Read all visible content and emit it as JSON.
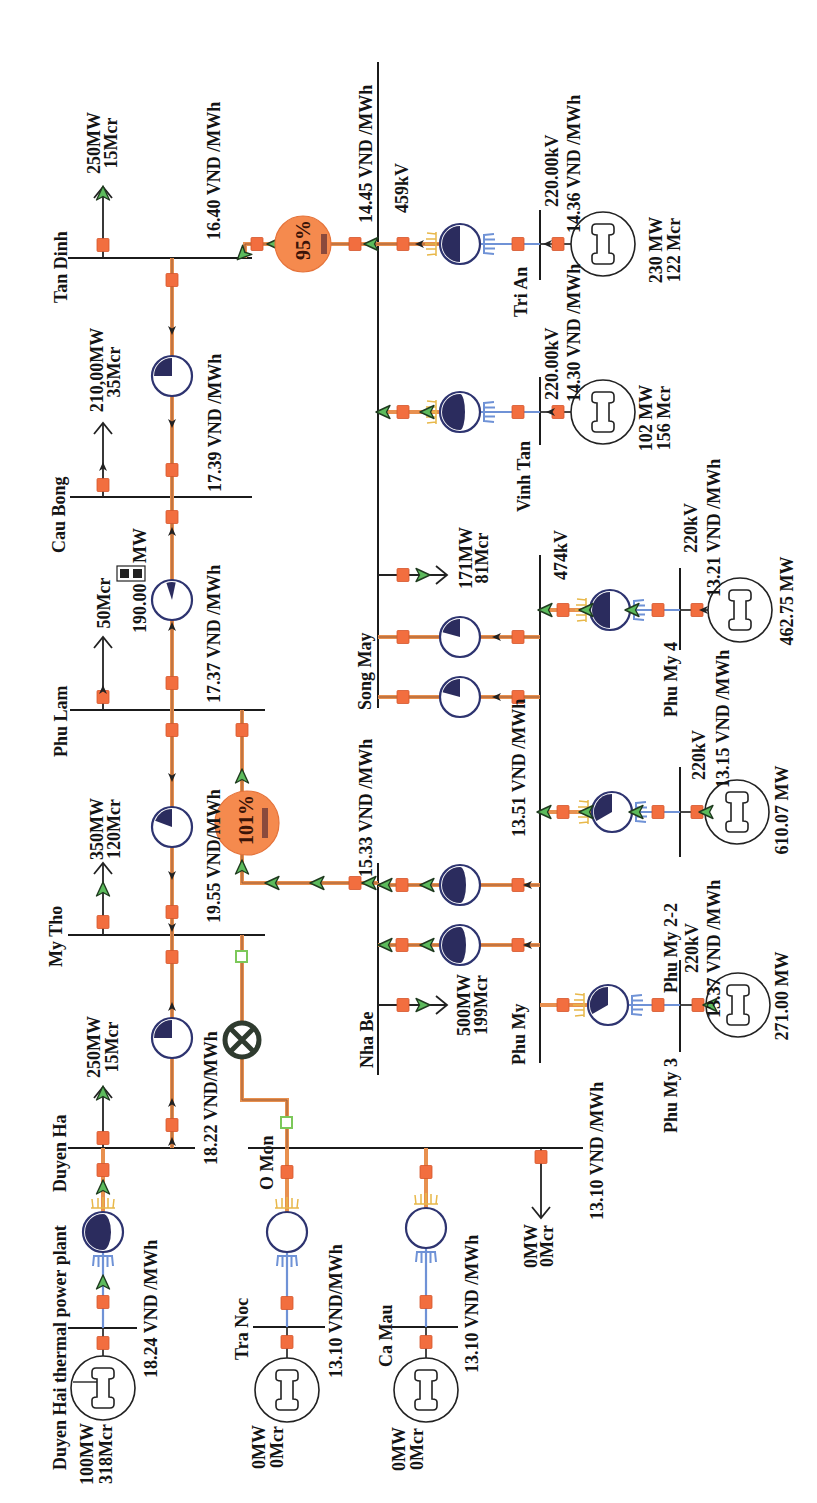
{
  "diagram": {
    "kind": "power system one-line diagram",
    "orientation": "rotated 90 degrees counter-clockwise"
  },
  "buses": {
    "tan_dinh": {
      "name": "Tan Dinh",
      "price": "16.40 VND /MWh"
    },
    "cau_bong": {
      "name": "Cau Bong",
      "price": "17.39 VND /MWh"
    },
    "phu_lam": {
      "name": "Phu Lam",
      "price": "17.37 VND /MWh"
    },
    "my_tho": {
      "name": "My Tho",
      "price": "19.55 VND/MWh"
    },
    "duyen_ha": {
      "name": "Duyen Ha",
      "price": "18.22 VND/MWh"
    },
    "duyen_hai": {
      "name": "Duyen  Hai thermal power plant",
      "price": "18.24 VND /MWh"
    },
    "o_mon": {
      "name": "O Mon",
      "price": "13.10 VND /MWh"
    },
    "tra_noc": {
      "name": "Tra Noc",
      "price": "13.10 VND/MWh"
    },
    "ca_mau": {
      "name": "Ca Mau",
      "price": "13.10 VND /MWh"
    },
    "song_may": {
      "name": "Song May",
      "voltage": "459kV",
      "price": "14.45 VND /MWh"
    },
    "nha_be": {
      "name": "Nha Be",
      "price": "15.33 VND /MWh"
    },
    "phu_my": {
      "name": "Phu My",
      "voltage": "474kV",
      "price": "13.51 VND /MWh"
    },
    "tri_an": {
      "name": "Tri An",
      "voltage": "220.00kV",
      "price": "14.36 VND /MWh"
    },
    "vinh_tan": {
      "name": "Vinh Tan",
      "voltage": "220.00kV",
      "price": "14.30 VND /MWh"
    },
    "phu_my_4": {
      "name": "Phu My 4",
      "voltage": "220kV",
      "price": "13.21 VND /MWh"
    },
    "phu_my_2_2": {
      "name": "Phu My 2-2",
      "voltage": "220kV",
      "price": "13.15 VND /MWh"
    },
    "phu_my_3": {
      "name": "Phu My 3",
      "voltage": "220kV",
      "price": "13.37 VND /MWh"
    }
  },
  "loads": {
    "tan_dinh": {
      "mw": "250MW",
      "mvar": "15Mcr"
    },
    "cau_bong": {
      "mw": "210,00MW",
      "mvar": "35Mcr"
    },
    "phu_lam": {
      "mvar": "50Mcr",
      "flow_value": "190.00",
      "flow_unit": "MW"
    },
    "my_tho": {
      "mw": "350MW",
      "mvar": "120Mcr"
    },
    "duyen_ha": {
      "mw": "250MW",
      "mvar": "15Mcr"
    },
    "o_mon": {
      "mw": "0MW",
      "mvar": "0Mcr"
    },
    "song_may": {
      "mw": "171MW",
      "mvar": "81Mcr"
    },
    "nha_be": {
      "mw": "500MW",
      "mvar": "199Mcr"
    }
  },
  "generators": {
    "duyen_hai": {
      "mw": "100MW",
      "mvar": "318Mcr"
    },
    "tra_noc": {
      "mw": "0MW",
      "mvar": "0Mcr"
    },
    "ca_mau": {
      "mw": "0MW",
      "mvar": "0Mcr"
    },
    "tri_an": {
      "mw": "230 MW",
      "mvar": "122 Mcr"
    },
    "vinh_tan": {
      "mw": "102 MW",
      "mvar": "156 Mcr"
    },
    "phu_my_4": {
      "mw": "462.75 MW"
    },
    "phu_my_2_2": {
      "mw": "610.07 MW"
    },
    "phu_my_3": {
      "mw": "271.00 MW"
    }
  },
  "line_loadings": {
    "tan_dinh_song_may": {
      "label": "95%",
      "status": "near limit"
    },
    "phu_lam_nha_be": {
      "label": "101%",
      "status": "overloaded"
    }
  },
  "colors": {
    "line_orange": "#E8904F",
    "breaker": "#F26E3F",
    "flow_arrow_green": "#5CBB5C",
    "transformer_navy": "#2E3470",
    "loading_circle": "#F58A4E",
    "cooling_blue": "#6F92D6",
    "heat_yellow": "#E8B84A",
    "bus_black": "#1B1B1B"
  }
}
